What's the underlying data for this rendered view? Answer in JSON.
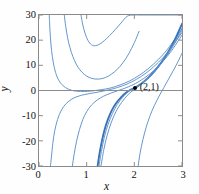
{
  "figure": {
    "background": "#ffffff",
    "frame_color": "#8a8a8a",
    "curve_color": "#5a8fc8",
    "highlight_curve_color": "#3a72b8",
    "marker_color": "#000000"
  },
  "chart_data": {
    "type": "line",
    "title": "",
    "subtitle": "",
    "xlabel": "x",
    "ylabel": "y",
    "xlim": [
      0,
      3
    ],
    "ylim": [
      -30,
      30
    ],
    "xticks": [
      "0",
      "1",
      "2",
      "3"
    ],
    "xtick_values": [
      0,
      1,
      2,
      3
    ],
    "yticks": [
      "30",
      "20",
      "10",
      "0",
      "-10",
      "-20",
      "-30"
    ],
    "ytick_values": [
      30,
      20,
      10,
      0,
      -10,
      -20,
      -30
    ],
    "grid": false,
    "legend": null,
    "legend_position": "none",
    "zero_line": true,
    "annotations": [
      {
        "label": "(2,1)",
        "x": 2,
        "y": 1,
        "marker": "filled-circle",
        "label_offset_x": 5,
        "label_offset_y": -6
      }
    ],
    "series": [
      {
        "name": "curve-1",
        "c": 0.55,
        "emphasis": false,
        "x": [
          0.215,
          0.23,
          0.25,
          0.28,
          0.32,
          0.38,
          0.46,
          0.56,
          0.68,
          0.8,
          0.95,
          1.1,
          1.3,
          1.5,
          1.7,
          1.9,
          2.1,
          2.3,
          2.5,
          2.7,
          3.0
        ],
        "y": [
          30,
          24.0,
          18.5,
          13.5,
          9.2,
          5.4,
          2.8,
          1.1,
          0.1,
          -0.3,
          -0.4,
          -0.2,
          0.3,
          1.0,
          2.2,
          3.8,
          6.0,
          8.8,
          12.3,
          16.5,
          24.5
        ]
      },
      {
        "name": "curve-2",
        "c": 1.6,
        "emphasis": false,
        "x": [
          0.24,
          0.26,
          0.29,
          0.33,
          0.39,
          0.47,
          0.57,
          0.69,
          0.82,
          0.96,
          1.1,
          1.25,
          1.45,
          1.65,
          1.85,
          2.05,
          2.25,
          2.45,
          2.7,
          3.0
        ],
        "y": [
          -30,
          -26.5,
          -21.0,
          -16.0,
          -11.5,
          -7.8,
          -5.2,
          -3.4,
          -2.3,
          -1.6,
          -1.1,
          -0.6,
          0.2,
          1.2,
          2.6,
          4.5,
          7.0,
          10.2,
          15.2,
          23.0
        ]
      },
      {
        "name": "curve-3",
        "c": 3.2,
        "emphasis": false,
        "x": [
          0.7,
          0.74,
          0.79,
          0.85,
          0.92,
          1.0,
          1.1,
          1.22,
          1.35,
          1.5,
          1.65,
          1.8,
          1.95,
          2.1,
          2.3,
          2.5,
          2.75,
          3.0
        ],
        "y": [
          -30,
          -25.0,
          -20.0,
          -15.5,
          -11.5,
          -8.4,
          -5.8,
          -3.8,
          -2.3,
          -1.1,
          -0.1,
          0.9,
          2.1,
          3.6,
          6.2,
          9.6,
          15.0,
          22.0
        ]
      },
      {
        "name": "curve-4",
        "c": 5.0,
        "emphasis": true,
        "x": [
          1.23,
          1.27,
          1.32,
          1.38,
          1.45,
          1.53,
          1.62,
          1.72,
          1.83,
          1.92,
          2.0,
          2.08,
          2.18,
          2.3,
          2.42,
          2.55,
          2.7,
          2.85,
          3.0
        ],
        "y": [
          -30,
          -25.0,
          -20.0,
          -15.3,
          -11.3,
          -7.8,
          -5.0,
          -2.7,
          -0.8,
          0.3,
          1.0,
          1.9,
          3.2,
          5.2,
          7.6,
          10.7,
          15.0,
          20.2,
          26.5
        ]
      },
      {
        "name": "curve-5",
        "c": 5.6,
        "emphasis": false,
        "x": [
          1.3,
          1.36,
          1.43,
          1.52,
          1.62,
          1.73,
          1.85,
          1.95,
          2.03,
          2.12,
          2.24,
          2.37,
          2.5,
          2.65,
          2.8,
          3.0
        ],
        "y": [
          -30,
          -23.5,
          -17.8,
          -12.5,
          -8.2,
          -4.8,
          -2.0,
          -0.3,
          0.8,
          2.1,
          4.0,
          6.4,
          9.2,
          12.9,
          17.2,
          23.8
        ]
      },
      {
        "name": "curve-6",
        "c": -4.0,
        "emphasis": false,
        "x": [
          0.88,
          0.92,
          0.97,
          1.03,
          1.1,
          1.18,
          1.27,
          1.37,
          1.48,
          1.6,
          1.72,
          1.85,
          1.98,
          2.12,
          2.28,
          2.45,
          2.62,
          2.8,
          3.0
        ],
        "y": [
          30,
          26.0,
          22.5,
          19.8,
          18.2,
          17.8,
          18.4,
          19.8,
          21.8,
          24.2,
          26.8,
          29.5,
          30,
          30,
          30,
          30,
          30,
          30,
          30
        ]
      },
      {
        "name": "curve-7",
        "c": -9.0,
        "emphasis": false,
        "x": [
          0.53,
          0.56,
          0.6,
          0.65,
          0.71,
          0.78,
          0.86,
          0.95,
          1.05,
          1.16,
          1.28,
          1.4,
          1.52,
          1.64,
          1.76,
          1.88,
          2.0,
          2.1
        ],
        "y": [
          30,
          25.5,
          21.0,
          17.0,
          13.5,
          10.5,
          8.2,
          6.4,
          5.2,
          4.6,
          4.6,
          5.2,
          6.5,
          8.4,
          11.0,
          14.5,
          19.0,
          23.5
        ]
      },
      {
        "name": "curve-8",
        "c": 8.5,
        "emphasis": false,
        "x": [
          2.08,
          2.12,
          2.18,
          2.25,
          2.33,
          2.42,
          2.52,
          2.62,
          2.72,
          2.82,
          2.92,
          3.0
        ],
        "y": [
          -30,
          -25.0,
          -19.5,
          -14.5,
          -10.0,
          -6.0,
          -2.2,
          1.2,
          4.6,
          8.0,
          11.6,
          14.8
        ]
      },
      {
        "name": "curve-9",
        "c": 5.3,
        "emphasis": false,
        "x": [
          1.26,
          1.31,
          1.37,
          1.45,
          1.54,
          1.64,
          1.75,
          1.86,
          1.96,
          2.05,
          2.15,
          2.27,
          2.4,
          2.54,
          2.7,
          2.86,
          3.0
        ],
        "y": [
          -30,
          -24.2,
          -18.6,
          -13.4,
          -9.2,
          -5.6,
          -2.8,
          -0.6,
          0.6,
          1.5,
          2.9,
          4.9,
          7.5,
          10.8,
          15.0,
          19.8,
          24.8
        ]
      }
    ]
  }
}
